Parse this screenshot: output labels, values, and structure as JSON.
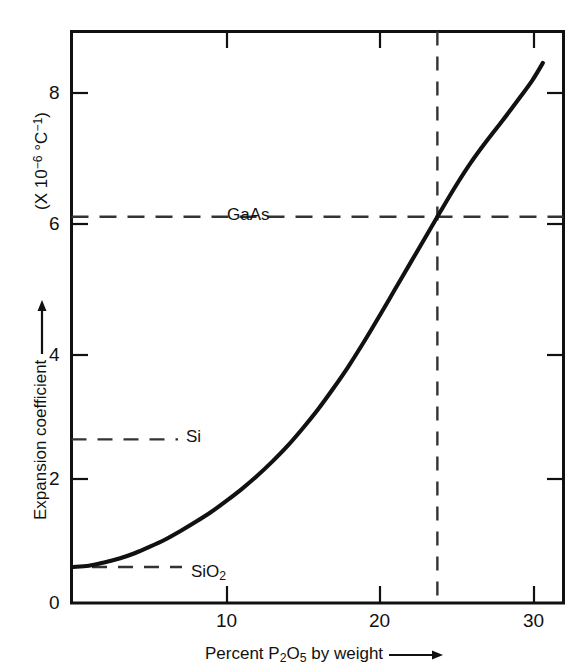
{
  "chart_data": {
    "type": "line",
    "title": "",
    "subtitle": "",
    "xlabel": "Percent P2O5 by weight",
    "ylabel": "Expansion coefficient",
    "y_unit": "(X 10^-6 °C^-1)",
    "xlim": [
      0,
      32.05
    ],
    "ylim": [
      0,
      8.73
    ],
    "grid": false,
    "legend": "none",
    "x_ticks": [
      10,
      20,
      30
    ],
    "x_tick_labels": [
      "10",
      "20",
      "30"
    ],
    "y_ticks": [
      0,
      2,
      4,
      6,
      8
    ],
    "y_tick_labels": [
      "0",
      "2",
      "4",
      "6",
      "8"
    ],
    "series": [
      {
        "name": "Expansion coefficient vs P2O5 content",
        "x": [
          0.0,
          1.0,
          2.0,
          3.0,
          4.0,
          5.0,
          6.0,
          7.0,
          8.0,
          9.0,
          10.0,
          11.0,
          12.0,
          13.0,
          14.0,
          15.0,
          16.0,
          17.0,
          18.0,
          19.0,
          20.0,
          21.0,
          22.0,
          23.0,
          23.8,
          24.0,
          25.0,
          26.0,
          27.0,
          28.0,
          29.0,
          30.0,
          30.7
        ],
        "y": [
          0.55,
          0.57,
          0.62,
          0.68,
          0.76,
          0.86,
          0.97,
          1.1,
          1.24,
          1.39,
          1.56,
          1.74,
          1.94,
          2.16,
          2.4,
          2.67,
          2.96,
          3.28,
          3.62,
          3.99,
          4.38,
          4.78,
          5.18,
          5.58,
          5.9,
          5.98,
          6.37,
          6.73,
          7.05,
          7.35,
          7.66,
          7.98,
          8.25
        ]
      }
    ],
    "reference_lines": [
      {
        "label": "GaAs",
        "value": 5.9,
        "orientation": "horizontal",
        "style": "dashed",
        "extent": "full-width"
      },
      {
        "label": "Si",
        "value": 2.5,
        "orientation": "horizontal",
        "style": "dashed",
        "extent": "short"
      },
      {
        "label": "SiO2",
        "value": 0.55,
        "orientation": "horizontal",
        "style": "dashed",
        "extent": "short"
      },
      {
        "label": "",
        "value": 23.8,
        "orientation": "vertical",
        "style": "dashed",
        "extent": "full-height"
      }
    ],
    "annotations": [
      {
        "text": "GaAs",
        "x": 10.2,
        "y": 6.18
      },
      {
        "text": "Si",
        "x": 7.6,
        "y": 2.72
      },
      {
        "text": "SiO2",
        "x": 8.0,
        "y": 0.78
      }
    ]
  },
  "axes": {
    "x_tick_labels": [
      "10",
      "20",
      "30"
    ],
    "y_tick_labels": [
      "0",
      "2",
      "4",
      "6",
      "8"
    ],
    "x_title_prefix": "Percent P",
    "x_title_sub1": "2",
    "x_title_mid": "O",
    "x_title_sub2": "5",
    "x_title_suffix": " by weight",
    "y_title": "Expansion coefficient",
    "y_unit_open": "(X 10",
    "y_unit_exp1": "−6",
    "y_unit_mid": " °C",
    "y_unit_exp2": "−1",
    "y_unit_close": ")"
  },
  "reference_labels": {
    "gaas": "GaAs",
    "si": "Si",
    "sio2_prefix": "SiO",
    "sio2_sub": "2"
  },
  "colors": {
    "line": "#111111",
    "axis": "#111111",
    "dashed": "#333333",
    "background": "#ffffff"
  }
}
